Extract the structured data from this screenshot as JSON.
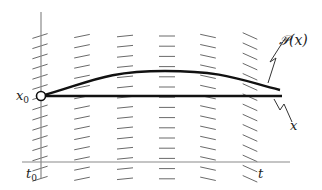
{
  "diagram": {
    "title": "",
    "labels": {
      "x0_main": "x",
      "x0_sub": "0",
      "t0_main": "t",
      "t0_sub": "0",
      "t_axis": "t",
      "P_curve": "𝒫(x)",
      "x_line": "x"
    },
    "colors": {
      "axis": "#8a8a8a",
      "curve": "#111111",
      "slope_marks": "#6a6a6a",
      "background": "#ffffff"
    },
    "slope_field": {
      "columns_x": [
        40,
        82,
        125,
        167,
        208,
        250
      ],
      "slopes": [
        -0.32,
        -0.2,
        -0.1,
        0.0,
        0.22,
        0.45
      ],
      "marks_per_column": 15,
      "y_start": 36,
      "y_step": 10.2,
      "half_length": 8
    },
    "axes": {
      "t_axis": {
        "x1": 22,
        "x2": 290,
        "y": 162
      },
      "x_axis": {
        "x": 41,
        "y1": 12,
        "y2": 178
      }
    },
    "curves": {
      "x_line": {
        "x1": 41,
        "x2": 282,
        "y": 96
      },
      "P_curve": {
        "start": [
          41,
          96
        ],
        "peak": [
          165,
          71
        ],
        "end": [
          280,
          90
        ]
      }
    },
    "initial_point": {
      "cx": 41,
      "cy": 96,
      "r": 4.5
    }
  }
}
